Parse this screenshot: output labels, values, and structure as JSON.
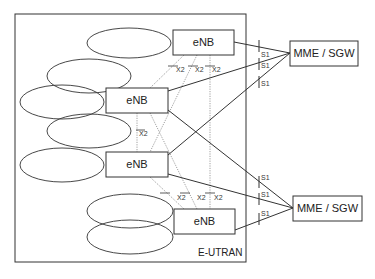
{
  "diagram": {
    "region_label": "E-UTRAN",
    "nodes": {
      "enb1": {
        "label": "eNB"
      },
      "enb2": {
        "label": "eNB"
      },
      "enb3": {
        "label": "eNB"
      },
      "enb4": {
        "label": "eNB"
      },
      "mme1": {
        "label": "MME / SGW"
      },
      "mme2": {
        "label": "MME / SGW"
      }
    },
    "x2_labels": [
      "X2",
      "X2",
      "X2",
      "X2",
      "X2",
      "X2",
      "X2"
    ],
    "s1_labels": [
      "S1",
      "S1",
      "S1",
      "S1",
      "S1",
      "S1"
    ],
    "edges": [
      {
        "type": "S1",
        "from": "enb1",
        "to": "mme1"
      },
      {
        "type": "S1",
        "from": "enb2",
        "to": "mme1"
      },
      {
        "type": "S1",
        "from": "enb3",
        "to": "mme1"
      },
      {
        "type": "S1",
        "from": "enb2",
        "to": "mme2"
      },
      {
        "type": "S1",
        "from": "enb3",
        "to": "mme2"
      },
      {
        "type": "S1",
        "from": "enb4",
        "to": "mme2"
      },
      {
        "type": "X2",
        "from": "enb1",
        "to": "enb2"
      },
      {
        "type": "X2",
        "from": "enb1",
        "to": "enb3"
      },
      {
        "type": "X2",
        "from": "enb1",
        "to": "enb4"
      },
      {
        "type": "X2",
        "from": "enb2",
        "to": "enb3"
      },
      {
        "type": "X2",
        "from": "enb2",
        "to": "enb4"
      },
      {
        "type": "X2",
        "from": "enb3",
        "to": "enb4"
      }
    ],
    "colors": {
      "line": "#333333",
      "dotted": "#888888",
      "background": "#ffffff"
    }
  }
}
